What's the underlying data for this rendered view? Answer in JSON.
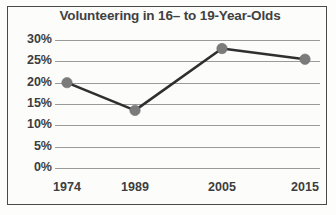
{
  "chart_data": {
    "type": "line",
    "title": "Volunteering in 16– to 19-Year-Olds",
    "xlabel": "",
    "ylabel": "",
    "categories": [
      "1974",
      "1989",
      "2005",
      "2015"
    ],
    "x": [
      1974,
      1989,
      2005,
      2015
    ],
    "values": [
      20,
      13.5,
      28,
      25.5
    ],
    "series": [
      {
        "name": "Volunteering rate",
        "values": [
          20,
          13.5,
          28,
          25.5
        ]
      }
    ],
    "ylim": [
      0,
      30
    ],
    "ytick_values": [
      30,
      25,
      20,
      15,
      10,
      5,
      0
    ],
    "ytick_labels": [
      "30%",
      "25%",
      "20%",
      "15%",
      "10%",
      "5%",
      "0%"
    ],
    "xtick_labels": [
      "1974",
      "1989",
      "2005",
      "2015"
    ],
    "grid": "horizontal",
    "legend": "none",
    "value_labels": "none",
    "colors": {
      "line": "#2f2f2f",
      "marker": "#7b7b7b",
      "gridline": "#9a9a9a",
      "text": "#3d3d3d",
      "title": "#414141",
      "border": "#4a4a4a",
      "background": "#fcfcfb"
    }
  }
}
